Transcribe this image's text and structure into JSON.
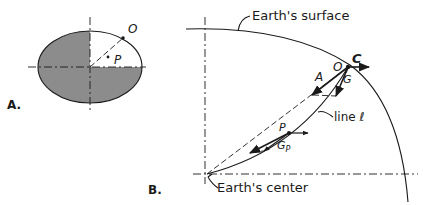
{
  "figure": {
    "panel_a": {
      "label": "A.",
      "point_o": "O",
      "point_p": "P",
      "shaded_quadrants": [
        "upper-left",
        "lower-left",
        "lower-right"
      ],
      "shade_color": "#8c8c8c"
    },
    "panel_b": {
      "label": "B.",
      "surface_label": "Earth's surface",
      "center_label": "Earth's center",
      "line_label": "line ℓ",
      "point_o": "O",
      "vector_a": "A",
      "vector_c": "C",
      "vector_g": "G",
      "point_p": "P",
      "vector_gp": "G",
      "vector_gp_sub": "P"
    }
  }
}
